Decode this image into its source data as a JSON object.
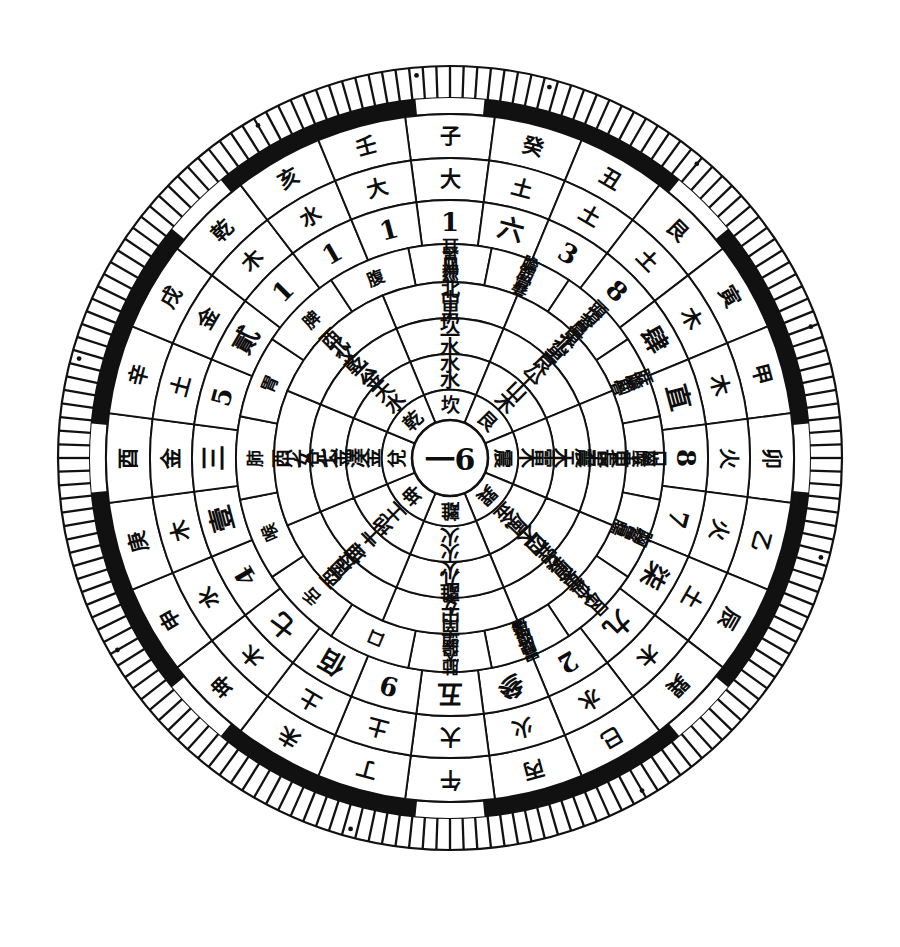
{
  "figure": {
    "kind": "luopan-compass-disc",
    "title": "",
    "background_color": "#ffffff",
    "ink_color": "#111111",
    "center": {
      "x": 450,
      "y": 458
    },
    "center_label": "一6",
    "center_label_parts": [
      "一",
      "6"
    ]
  },
  "rim": {
    "tick_ring": {
      "name": "graduated-degree-ring",
      "tick_count": 180,
      "outer_radius": 392,
      "inner_radius": 360
    },
    "black_band": {
      "name": "black-band-ring",
      "outer_radius": 360,
      "inner_radius": 344,
      "color": "#111111",
      "gap_color": "#ffffff",
      "gap_centers_deg": [
        0,
        45,
        90,
        135,
        180,
        225,
        270,
        315
      ],
      "gap_width_deg": 11
    },
    "dot_markers_deg": [
      15,
      40,
      70,
      105,
      150,
      195,
      240,
      285,
      330,
      355
    ]
  },
  "rings": [
    {
      "index": 0,
      "name": "ring-earthly-branches-outer",
      "r_outer": 344,
      "r_inner": 300,
      "sector_count": 24,
      "start_deg": -97.5,
      "font_size": 21,
      "cells": [
        "子",
        "癸",
        "丑",
        "艮",
        "寅",
        "甲",
        "卯",
        "乙",
        "辰",
        "巽",
        "巳",
        "丙",
        "午",
        "丁",
        "未",
        "坤",
        "申",
        "庚",
        "酉",
        "辛",
        "戌",
        "乾",
        "亥",
        "壬"
      ]
    },
    {
      "index": 1,
      "name": "ring-five-elements",
      "r_outer": 300,
      "r_inner": 258,
      "sector_count": 24,
      "start_deg": -97.5,
      "font_size": 21,
      "cells": [
        "大",
        "土",
        "土",
        "土",
        "木",
        "木",
        "火",
        "火",
        "土",
        "木",
        "水",
        "火",
        "大",
        "土",
        "土",
        "木",
        "水",
        "木",
        "金",
        "土",
        "金",
        "木",
        "水",
        "大"
      ]
    },
    {
      "index": 2,
      "name": "ring-numbers-arabic-chinese",
      "r_outer": 258,
      "r_inner": 214,
      "sector_count": 24,
      "start_deg": -97.5,
      "font_size": 26,
      "cells": [
        "1",
        "六",
        "3",
        "8",
        "肆",
        "直",
        "8",
        "7",
        "柒",
        "九",
        "2",
        "參",
        "五",
        "9",
        "佰",
        "七",
        "4",
        "壹",
        "三",
        "5",
        "貳",
        "1",
        "1",
        "1"
      ]
    },
    {
      "index": 3,
      "name": "ring-organ-body-parts",
      "r_outer": 214,
      "r_inner": 176,
      "sector_count": 16,
      "start_deg": -101.25,
      "font_size": 17,
      "cells": [
        "耳腎血神經",
        "膽筋骨髮",
        "頭項背肩",
        "肝膽筋骨",
        "口齒喉舌",
        "胸脅胃腸",
        "目心大血灸",
        "胃脾腹皮膚",
        "肺大腸頭",
        "口",
        "舌",
        "喉",
        "肺",
        "胃",
        "脾",
        "腹"
      ]
    },
    {
      "index": 4,
      "name": "ring-direction-family",
      "r_outer": 176,
      "r_inner": 140,
      "sector_count": 8,
      "start_deg": -112.5,
      "font_size": 19,
      "cells": [
        "北中男",
        "東北少男",
        "東長男",
        "東南長女",
        "南中女",
        "西南母",
        "西少女",
        "西北父"
      ]
    },
    {
      "index": 5,
      "name": "ring-trigram-number-element",
      "r_outer": 140,
      "r_inner": 104,
      "sector_count": 8,
      "start_deg": -112.5,
      "font_size": 20,
      "cells": [
        "坎一水",
        "艮八土",
        "震三木",
        "巽四木",
        "離九火",
        "坤二土",
        "兌七金",
        "乾六金"
      ]
    },
    {
      "index": 6,
      "name": "ring-nature-symbol",
      "r_outer": 104,
      "r_inner": 68,
      "sector_count": 8,
      "start_deg": -112.5,
      "font_size": 20,
      "cells": [
        "水水",
        "山木",
        "雷木",
        "風金",
        "火火",
        "地土",
        "澤金",
        "天水"
      ]
    },
    {
      "index": 7,
      "name": "ring-eight-trigrams",
      "r_outer": 68,
      "r_inner": 38,
      "sector_count": 8,
      "start_deg": -112.5,
      "font_size": 19,
      "cells": [
        "坎",
        "艮",
        "震",
        "巽",
        "離",
        "坤",
        "兌",
        "乾"
      ]
    }
  ],
  "center_disc": {
    "name": "center-disc",
    "radius": 38,
    "font_size": 30
  }
}
